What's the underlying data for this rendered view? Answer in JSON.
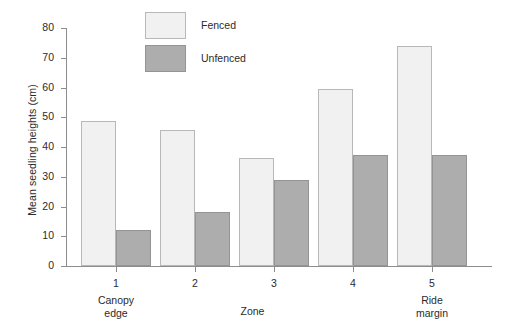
{
  "chart_data": {
    "type": "bar",
    "title": "",
    "xlabel": "Zone",
    "ylabel": "Mean seedling heights (cm)",
    "categories": [
      "1",
      "2",
      "3",
      "4",
      "5"
    ],
    "category_sublabels": [
      "Canopy edge",
      "",
      "",
      "",
      "Ride margin"
    ],
    "series": [
      {
        "name": "Fenced",
        "color": "#f1f1f1",
        "values": [
          48.7,
          45.7,
          36.2,
          59.6,
          73.8
        ]
      },
      {
        "name": "Unfenced",
        "color": "#adadad",
        "values": [
          12.2,
          18.0,
          28.8,
          37.3,
          37.3
        ]
      }
    ],
    "ylim": [
      0,
      80
    ],
    "yticks": [
      0,
      10,
      20,
      30,
      40,
      50,
      60,
      70,
      80
    ],
    "ytick_labels": [
      "0",
      "10",
      "20",
      "30",
      "40",
      "50",
      "60",
      "70",
      "80"
    ],
    "grid": false,
    "legend_position": "top-center"
  },
  "legend": {
    "items": [
      {
        "label": "Fenced"
      },
      {
        "label": "Unfenced"
      }
    ]
  },
  "axes": {
    "y_label": "Mean seedling heights (cm)",
    "x_label": "Zone"
  },
  "x_sublabels": {
    "zone1_line1": "Canopy",
    "zone1_line2": "edge",
    "zone5_line1": "Ride",
    "zone5_line2": "margin"
  }
}
